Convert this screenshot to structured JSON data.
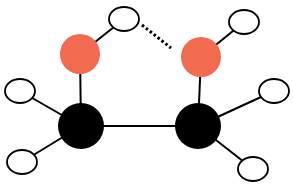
{
  "diagram": {
    "colors": {
      "oxygen": "#f26a4f",
      "carbon": "#000000",
      "hydrogen": "#ffffff",
      "bond": "#000000"
    },
    "atoms": [
      {
        "id": "O1",
        "element": "O",
        "x": 80,
        "y": 54,
        "r": 20
      },
      {
        "id": "O2",
        "element": "O",
        "x": 201,
        "y": 57,
        "r": 20
      },
      {
        "id": "C1",
        "element": "C",
        "x": 81,
        "y": 126,
        "r": 23
      },
      {
        "id": "C2",
        "element": "C",
        "x": 198,
        "y": 126,
        "r": 23
      },
      {
        "id": "H1",
        "element": "H",
        "x": 124,
        "y": 19
      },
      {
        "id": "H2",
        "element": "H",
        "x": 244,
        "y": 22
      },
      {
        "id": "H3",
        "element": "H",
        "x": 20,
        "y": 91
      },
      {
        "id": "H4",
        "element": "H",
        "x": 22,
        "y": 162
      },
      {
        "id": "H5",
        "element": "H",
        "x": 274,
        "y": 91
      },
      {
        "id": "H6",
        "element": "H",
        "x": 253,
        "y": 169
      }
    ],
    "bonds": [
      [
        "O1",
        "H1"
      ],
      [
        "O2",
        "H2"
      ],
      [
        "O1",
        "C1"
      ],
      [
        "O2",
        "C2"
      ],
      [
        "C1",
        "C2"
      ],
      [
        "C1",
        "H3"
      ],
      [
        "C1",
        "H4"
      ],
      [
        "C2",
        "H5"
      ],
      [
        "C2",
        "H6"
      ]
    ],
    "hydrogen_bond": {
      "from": [
        142,
        25
      ],
      "to": [
        171,
        48
      ]
    }
  }
}
